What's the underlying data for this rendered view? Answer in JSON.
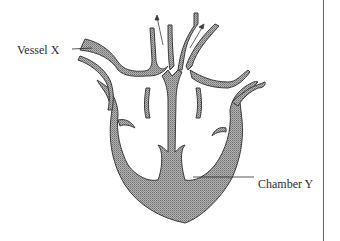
{
  "diagram": {
    "labels": {
      "vessel": "Vessel X",
      "chamber": "Chamber Y"
    },
    "colors": {
      "wall_fill": "#9a9a9a",
      "outline": "#3a3a3a",
      "text": "#2a2a2a",
      "background": "#ffffff"
    }
  }
}
